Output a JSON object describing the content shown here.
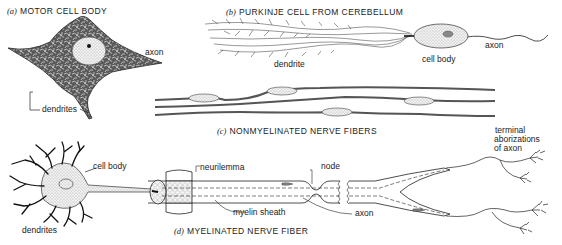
{
  "panels": {
    "a": {
      "letter": "(a)",
      "title": "MOTOR CELL BODY",
      "labels": {
        "axon": "axon",
        "dendrites": "dendrites"
      }
    },
    "b": {
      "letter": "(b)",
      "title": "PURKINJE CELL FROM CEREBELLUM",
      "labels": {
        "dendrite": "dendrite",
        "cell_body": "cell body",
        "axon": "axon"
      }
    },
    "c": {
      "letter": "(c)",
      "title": "NONMYELINATED NERVE FIBERS"
    },
    "d": {
      "letter": "(d)",
      "title": "MYELINATED NERVE FIBER",
      "labels": {
        "cell_body": "cell body",
        "dendrites": "dendrites",
        "neurilemma": "neurilemma",
        "myelin_sheath": "myelin sheath",
        "node": "node",
        "axon": "axon",
        "terminal_line1": "terminal",
        "terminal_line2": "aborizations",
        "terminal_line3": "of axon"
      }
    }
  },
  "colors": {
    "ink": "#1a1a1a",
    "shade_dark": "#555555",
    "shade_mid": "#9a9a9a",
    "stipple": "#d8d8d8",
    "background": "#ffffff"
  }
}
